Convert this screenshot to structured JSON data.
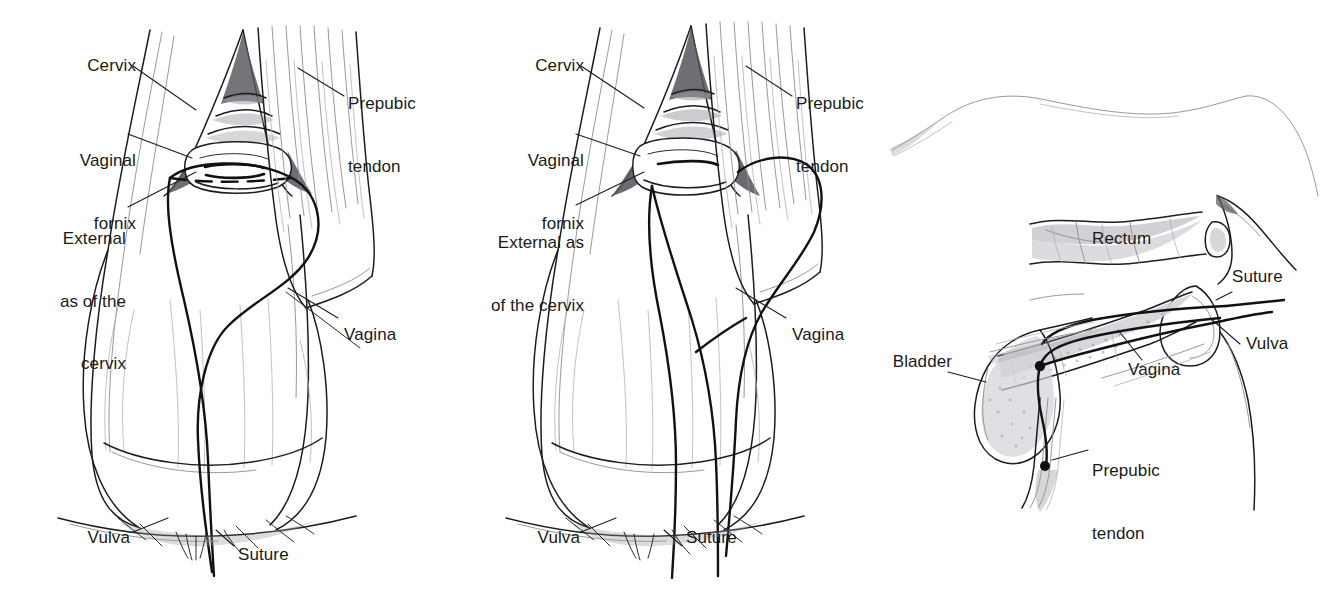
{
  "figure": {
    "type": "medical-illustration",
    "style": "pencil line drawing",
    "background_color": "#ffffff",
    "ink_color": "#1d1d1d",
    "panel_count": 3
  },
  "panels": [
    {
      "id": "panel-left",
      "view": "caudal view of vagina and cervix, suture being placed",
      "labels": [
        {
          "id": "cervix",
          "text": "Cervix",
          "lines": [
            "Cervix"
          ]
        },
        {
          "id": "vaginal-fornix",
          "text": "Vaginal fornix",
          "lines": [
            "Vaginal",
            "fornix"
          ]
        },
        {
          "id": "external-os",
          "text": "External as of the cervix",
          "lines": [
            "External",
            "as of the",
            "cervix"
          ]
        },
        {
          "id": "prepubic-tendon",
          "text": "Prepubic tendon",
          "lines": [
            "Prepubic",
            "tendon"
          ]
        },
        {
          "id": "vagina",
          "text": "Vagina",
          "lines": [
            "Vagina"
          ]
        },
        {
          "id": "vulva",
          "text": "Vulva",
          "lines": [
            "Vulva"
          ]
        },
        {
          "id": "suture",
          "text": "Suture",
          "lines": [
            "Suture"
          ]
        }
      ]
    },
    {
      "id": "panel-middle",
      "view": "caudal view, suture anchored through prepubic tendon, both strands exiting vulva",
      "labels": [
        {
          "id": "cervix",
          "text": "Cervix",
          "lines": [
            "Cervix"
          ]
        },
        {
          "id": "vaginal-fornix",
          "text": "Vaginal fornix",
          "lines": [
            "Vaginal",
            "fornix"
          ]
        },
        {
          "id": "external-os",
          "text": "External as of the cervix",
          "lines": [
            "External as",
            "of the cervix"
          ]
        },
        {
          "id": "prepubic-tendon",
          "text": "Prepubic tendon",
          "lines": [
            "Prepubic",
            "tendon"
          ]
        },
        {
          "id": "vagina",
          "text": "Vagina",
          "lines": [
            "Vagina"
          ]
        },
        {
          "id": "vulva",
          "text": "Vulva",
          "lines": [
            "Vulva"
          ]
        },
        {
          "id": "suture",
          "text": "Suture",
          "lines": [
            "Suture"
          ]
        }
      ]
    },
    {
      "id": "panel-right",
      "view": "sagittal section showing rectum, bladder, vagina, vulva and suture around prepubic tendon",
      "labels": [
        {
          "id": "rectum",
          "text": "Rectum",
          "lines": [
            "Rectum"
          ]
        },
        {
          "id": "suture",
          "text": "Suture",
          "lines": [
            "Suture"
          ]
        },
        {
          "id": "vulva",
          "text": "Vulva",
          "lines": [
            "Vulva"
          ]
        },
        {
          "id": "bladder",
          "text": "Bladder",
          "lines": [
            "Bladder"
          ]
        },
        {
          "id": "vagina",
          "text": "Vagina",
          "lines": [
            "Vagina"
          ]
        },
        {
          "id": "prepubic-tendon",
          "text": "Prepubic tendon",
          "lines": [
            "Prepubic",
            "tendon"
          ]
        }
      ]
    }
  ],
  "left": {
    "cervix": "Cervix",
    "fornix_1": "Vaginal",
    "fornix_2": "fornix",
    "os_1": "External",
    "os_2": "as of the",
    "os_3": "cervix",
    "tendon_1": "Prepubic",
    "tendon_2": "tendon",
    "vagina": "Vagina",
    "vulva": "Vulva",
    "suture": "Suture"
  },
  "middle": {
    "cervix": "Cervix",
    "fornix_1": "Vaginal",
    "fornix_2": "fornix",
    "os_1": "External as",
    "os_2": "of the cervix",
    "tendon_1": "Prepubic",
    "tendon_2": "tendon",
    "vagina": "Vagina",
    "vulva": "Vulva",
    "suture": "Suture"
  },
  "right": {
    "rectum": "Rectum",
    "suture": "Suture",
    "vulva": "Vulva",
    "bladder": "Bladder",
    "vagina": "Vagina",
    "tendon_1": "Prepubic",
    "tendon_2": "tendon"
  }
}
